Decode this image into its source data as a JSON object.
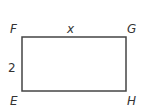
{
  "diagram": {
    "type": "rectangle",
    "vertices": {
      "top_left": "F",
      "top_right": "G",
      "bottom_left": "E",
      "bottom_right": "H"
    },
    "side_labels": {
      "top": "x",
      "left": "2"
    },
    "colors": {
      "stroke": "#444444",
      "label": "#333333",
      "background": "#ffffff"
    }
  }
}
